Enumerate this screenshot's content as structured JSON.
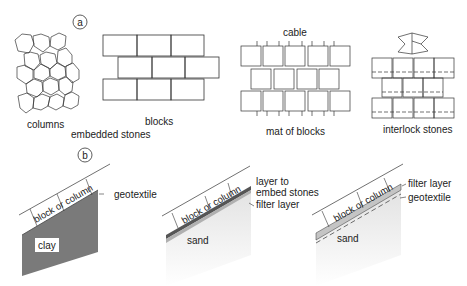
{
  "panel_a": {
    "marker": "a",
    "items": {
      "columns": "columns",
      "blocks": "blocks",
      "embedded": "embedded stones",
      "cable": "cable",
      "mat": "mat of blocks",
      "interlock": "interlock stones"
    }
  },
  "panel_b": {
    "marker": "b",
    "sections": [
      {
        "block": "block or column",
        "sub": "clay",
        "layers": [
          "geotextile"
        ]
      },
      {
        "block": "block or column",
        "sub": "sand",
        "layers": [
          "layer to",
          "embed stones",
          "filter layer"
        ]
      },
      {
        "block": "block or column",
        "sub": "sand",
        "layers": [
          "filter layer",
          "geotextile"
        ]
      }
    ]
  },
  "colors": {
    "line": "#333333",
    "clay": "#7a7a7a",
    "sand_top": "#dcdcdc",
    "sand": "#f1f1f1",
    "dark_layer": "#555555",
    "filter": "#b8b8b8"
  }
}
